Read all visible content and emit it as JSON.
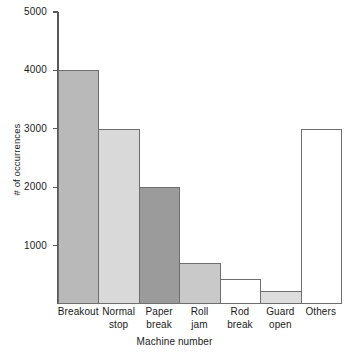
{
  "chart_data": {
    "type": "bar",
    "title": "",
    "xlabel": "Machine number",
    "ylabel": "# of occurrences",
    "categories": [
      "Breakout",
      "Normal stop",
      "Paper break",
      "Roll jam",
      "Rod break",
      "Guard open",
      "Others"
    ],
    "category_lines": [
      [
        "Breakout"
      ],
      [
        "Normal",
        "stop"
      ],
      [
        "Paper",
        "break"
      ],
      [
        "Roll",
        "jam"
      ],
      [
        "Rod",
        "break"
      ],
      [
        "Guard",
        "open"
      ],
      [
        "Others"
      ]
    ],
    "values": [
      4000,
      3000,
      2000,
      700,
      430,
      220,
      3000
    ],
    "bar_colors": [
      "#b9b9b9",
      "#d9d9d9",
      "#9b9b9b",
      "#c9c9c9",
      "#ffffff",
      "#dddddd",
      "#ffffff"
    ],
    "bar_edge_color": "#6e6e6e",
    "ylim": [
      0,
      5000
    ],
    "yticks": [
      1000,
      2000,
      3000,
      4000,
      5000
    ],
    "ytick_labels": [
      "1000",
      "2000",
      "3000",
      "4000",
      "5000"
    ],
    "grid": false,
    "legend": "none",
    "bar_gap": 0,
    "axis_color": "#585858",
    "background": "#ffffff"
  }
}
